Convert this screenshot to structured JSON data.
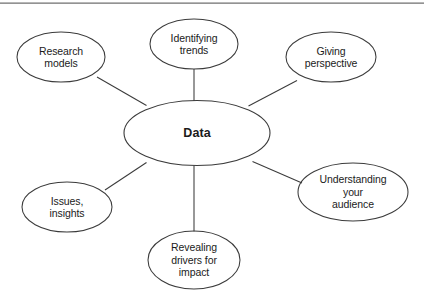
{
  "diagram": {
    "type": "mind-map",
    "title": "Data",
    "top_rule_color": "#6f6f6f",
    "stroke_color": "#3b3b3b",
    "text_color": "#1b1b1b",
    "background_color": "#ffffff",
    "center": {
      "id": "data",
      "label": "Data",
      "cx": 197,
      "cy": 133,
      "rx": 73,
      "ry": 32.5
    },
    "nodes": [
      {
        "id": "research-models",
        "label": "Research\nmodels",
        "cx": 61,
        "cy": 57,
        "rx": 44,
        "ry": 25,
        "link": {
          "x1": 146.5,
          "y1": 105.5,
          "x2": 97,
          "y2": 77
        }
      },
      {
        "id": "identifying-trends",
        "label": "Identifying\ntrends",
        "cx": 194,
        "cy": 44,
        "rx": 44,
        "ry": 25,
        "link": {
          "x1": 194,
          "y1": 101,
          "x2": 194,
          "y2": 69
        }
      },
      {
        "id": "giving-perspective",
        "label": "Giving\nperspective",
        "cx": 331,
        "cy": 57,
        "rx": 45,
        "ry": 25,
        "link": {
          "x1": 248.5,
          "y1": 106,
          "x2": 297,
          "y2": 80.5
        }
      },
      {
        "id": "understanding-your-audience",
        "label": "Understanding\nyour\naudience",
        "cx": 353,
        "cy": 192,
        "rx": 55,
        "ry": 29,
        "link": {
          "x1": 252.5,
          "y1": 161.5,
          "x2": 302,
          "y2": 183
        }
      },
      {
        "id": "revealing-drivers-for-impact",
        "label": "Revealing\ndrivers for\nimpact",
        "cx": 194,
        "cy": 260,
        "rx": 46,
        "ry": 29,
        "link": {
          "x1": 194,
          "y1": 165.5,
          "x2": 194,
          "y2": 231.5
        }
      },
      {
        "id": "issues-insights",
        "label": "Issues,\ninsights",
        "cx": 67,
        "cy": 207,
        "rx": 45,
        "ry": 25,
        "link": {
          "x1": 146.5,
          "y1": 162.5,
          "x2": 105,
          "y2": 190
        }
      }
    ]
  }
}
